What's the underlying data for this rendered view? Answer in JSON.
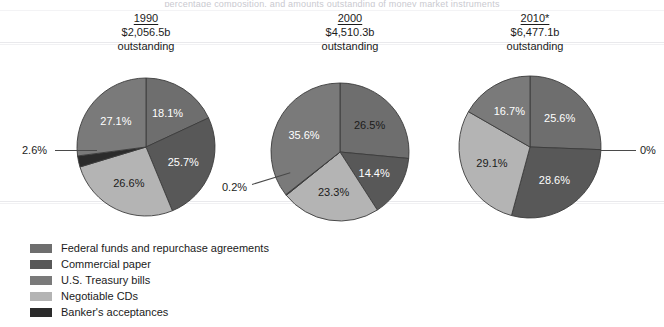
{
  "figure": {
    "cropped_top_text": "percentage composition, and amounts outstanding of money market instruments",
    "legend_items": [
      {
        "label": "Federal funds and repurchase agreements",
        "color": "#6e6e6e",
        "key": "fed_funds"
      },
      {
        "label": "Commercial paper",
        "color": "#585858",
        "key": "commercial_paper"
      },
      {
        "label": "U.S. Treasury bills",
        "color": "#7a7a7a",
        "key": "tbills"
      },
      {
        "label": "Negotiable CDs",
        "color": "#b4b4b4",
        "key": "cds"
      },
      {
        "label": "Banker's acceptances",
        "color": "#2b2b2b",
        "key": "acceptances"
      }
    ]
  },
  "columns": [
    {
      "year": "1990",
      "amount": "$2,056.5b",
      "outstanding": "outstanding"
    },
    {
      "year": "2000",
      "amount": "$4,510.3b",
      "outstanding": "outstanding"
    },
    {
      "year": "2010*",
      "amount": "$6,477.1b",
      "outstanding": "outstanding"
    }
  ],
  "chart_data": {
    "type": "pie",
    "xlabel": "",
    "ylabel": "",
    "legend_position": "bottom-left",
    "grid": false,
    "series_labels": [
      "Federal funds and repurchase agreements",
      "Commercial paper",
      "U.S. Treasury bills",
      "Negotiable CDs",
      "Banker's acceptances"
    ],
    "colors": [
      "#6e6e6e",
      "#585858",
      "#7a7a7a",
      "#b4b4b4",
      "#2b2b2b"
    ],
    "pies": [
      {
        "year": "1990",
        "total": "$2,056.5b",
        "total_value": 2056.5,
        "units": "billions of dollars",
        "slices": [
          {
            "category": "Federal funds and repurchase agreements",
            "value": 18.1,
            "label": "18.1%",
            "color": "#6e6e6e",
            "label_color": "light"
          },
          {
            "category": "Commercial paper",
            "value": 25.7,
            "label": "25.7%",
            "color": "#585858",
            "label_color": "light"
          },
          {
            "category": "Negotiable CDs",
            "value": 26.6,
            "label": "26.6%",
            "color": "#b4b4b4",
            "label_color": "dark"
          },
          {
            "category": "Banker's acceptances",
            "value": 2.6,
            "label": "2.6%",
            "color": "#2b2b2b",
            "label_color": "callout"
          },
          {
            "category": "U.S. Treasury bills",
            "value": 27.1,
            "label": "27.1%",
            "color": "#7a7a7a",
            "label_color": "light"
          }
        ]
      },
      {
        "year": "2000",
        "total": "$4,510.3b",
        "total_value": 4510.3,
        "units": "billions of dollars",
        "slices": [
          {
            "category": "Federal funds and repurchase agreements",
            "value": 26.5,
            "label": "26.5%",
            "color": "#6e6e6e",
            "label_color": "dark"
          },
          {
            "category": "Commercial paper",
            "value": 14.4,
            "label": "14.4%",
            "color": "#585858",
            "label_color": "light"
          },
          {
            "category": "Negotiable CDs",
            "value": 23.3,
            "label": "23.3%",
            "color": "#b4b4b4",
            "label_color": "dark"
          },
          {
            "category": "Banker's acceptances",
            "value": 0.2,
            "label": "0.2%",
            "color": "#2b2b2b",
            "label_color": "callout"
          },
          {
            "category": "U.S. Treasury bills",
            "value": 35.6,
            "label": "35.6%",
            "color": "#7a7a7a",
            "label_color": "light"
          }
        ]
      },
      {
        "year": "2010*",
        "total": "$6,477.1b",
        "total_value": 6477.1,
        "units": "billions of dollars",
        "slices": [
          {
            "category": "Federal funds and repurchase agreements",
            "value": 25.6,
            "label": "25.6%",
            "color": "#6e6e6e",
            "label_color": "light"
          },
          {
            "category": "Commercial paper",
            "value": 28.6,
            "label": "28.6%",
            "color": "#585858",
            "label_color": "light"
          },
          {
            "category": "Negotiable CDs",
            "value": 29.1,
            "label": "29.1%",
            "color": "#b4b4b4",
            "label_color": "dark"
          },
          {
            "category": "Banker's acceptances",
            "value": 0.0,
            "label": "0%",
            "color": "#2b2b2b",
            "label_color": "callout"
          },
          {
            "category": "U.S. Treasury bills",
            "value": 16.7,
            "label": "16.7%",
            "color": "#7a7a7a",
            "label_color": "light"
          }
        ]
      }
    ]
  },
  "callouts": [
    {
      "text": "2.6%",
      "pie": "1990"
    },
    {
      "text": "0.2%",
      "pie": "2000"
    },
    {
      "text": "0%",
      "pie": "2010*"
    }
  ]
}
